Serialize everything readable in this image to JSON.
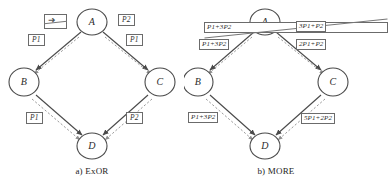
{
  "figure": {
    "panels": [
      {
        "id": "exor",
        "caption": "a) ExOR",
        "nodes": [
          {
            "id": "A",
            "label": "A"
          },
          {
            "id": "B",
            "label": "B"
          },
          {
            "id": "C",
            "label": "C"
          },
          {
            "id": "D",
            "label": "D"
          }
        ],
        "edge_labels": [
          {
            "id": "ab-upper",
            "text": "",
            "struck": true,
            "glyph": "diagonal-arrow"
          },
          {
            "id": "ab-lower",
            "text": "P1"
          },
          {
            "id": "ac-upper",
            "text": "P2"
          },
          {
            "id": "ac-lower",
            "text": "P1"
          },
          {
            "id": "bd",
            "text": "P1"
          },
          {
            "id": "cd",
            "text": "P2"
          }
        ]
      },
      {
        "id": "more",
        "caption": "b) MORE",
        "nodes": [
          {
            "id": "A",
            "label": "A"
          },
          {
            "id": "B",
            "label": "B"
          },
          {
            "id": "C",
            "label": "C"
          },
          {
            "id": "D",
            "label": "D"
          }
        ],
        "edge_labels": [
          {
            "id": "ab-upper",
            "text": "P1+3P2",
            "struck": true
          },
          {
            "id": "ab-lower",
            "text": "P1+3P2"
          },
          {
            "id": "ac-upper",
            "text": "3P1+P2"
          },
          {
            "id": "ac-lower",
            "text": "2P1+P2"
          },
          {
            "id": "bd",
            "text": "P1+3P2"
          },
          {
            "id": "cd",
            "text": "5P1+2P2"
          }
        ]
      }
    ],
    "colors": {
      "node_stroke": "#4a4a4a",
      "edge_solid": "#4a4a4a",
      "edge_dashed": "#8e8e8e",
      "box_stroke": "#6b6b6b",
      "text": "#2b2b2b",
      "background": "#ffffff"
    }
  }
}
